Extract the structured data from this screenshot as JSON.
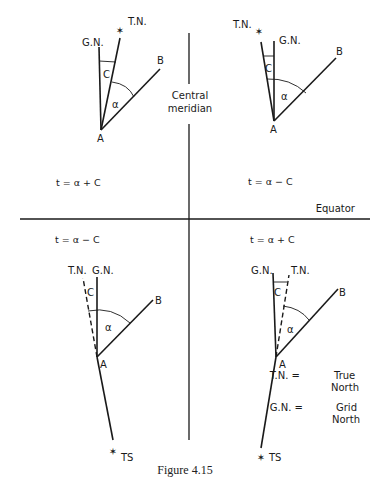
{
  "figure": {
    "caption": "Figure 4.15",
    "central_meridian_label_1": "Central",
    "central_meridian_label_2": "meridian",
    "equator_label": "Equator"
  },
  "quadrants": {
    "top_left": {
      "tn": "T.N.",
      "gn": "G.N.",
      "c": "C",
      "alpha": "α",
      "a": "A",
      "b": "B",
      "formula": "t = α + C"
    },
    "top_right": {
      "tn": "T.N.",
      "gn": "G.N.",
      "c": "C",
      "alpha": "α",
      "a": "A",
      "b": "B",
      "formula": "t = α − C"
    },
    "bottom_left": {
      "tn": "T.N.",
      "gn": "G.N.",
      "c": "C",
      "alpha": "α",
      "a": "A",
      "b": "B",
      "ts": "TS",
      "formula": "t = α − C"
    },
    "bottom_right": {
      "tn": "T.N.",
      "gn": "G.N.",
      "c": "C",
      "alpha": "α",
      "a": "A",
      "b": "B",
      "ts": "TS",
      "formula": "t = α + C"
    }
  },
  "legend": {
    "tn_key": "T.N. =",
    "tn_value_1": "True",
    "tn_value_2": "North",
    "gn_key": "G.N. =",
    "gn_value_1": "Grid",
    "gn_value_2": "North"
  }
}
